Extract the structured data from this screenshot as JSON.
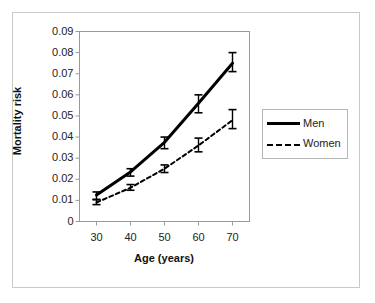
{
  "figure": {
    "background_color": "#ffffff",
    "border_color": "#c9c9c9",
    "plot_frame_color": "#9a9a9a"
  },
  "chart_data": {
    "type": "line",
    "title": "",
    "subtitle": "",
    "xlabel": "Age (years)",
    "ylabel": "Mortality risk",
    "x": [
      30,
      40,
      50,
      60,
      70
    ],
    "categories": [
      "30",
      "40",
      "50",
      "60",
      "70"
    ],
    "xlim": [
      25,
      75
    ],
    "ylim": [
      0,
      0.09
    ],
    "xticks": [
      30,
      40,
      50,
      60,
      70
    ],
    "xtick_labels": [
      "30",
      "40",
      "50",
      "60",
      "70"
    ],
    "yticks": [
      0,
      0.01,
      0.02,
      0.03,
      0.04,
      0.05,
      0.06,
      0.07,
      0.08,
      0.09
    ],
    "ytick_labels": [
      "0",
      "0.01",
      "0.02",
      "0.03",
      "0.04",
      "0.05",
      "0.06",
      "0.07",
      "0.08",
      "0.09"
    ],
    "grid": false,
    "legend_position": "right",
    "series": [
      {
        "name": "Men",
        "style": "solid",
        "color": "#000000",
        "line_width": 3,
        "values": [
          0.0125,
          0.0235,
          0.0375,
          0.056,
          0.075
        ],
        "error_low": [
          0.0105,
          0.0215,
          0.0345,
          0.0515,
          0.071
        ],
        "error_high": [
          0.014,
          0.025,
          0.04,
          0.06,
          0.08
        ]
      },
      {
        "name": "Women",
        "style": "dotted",
        "color": "#000000",
        "line_width": 2,
        "values": [
          0.009,
          0.016,
          0.025,
          0.036,
          0.048
        ],
        "error_low": [
          0.008,
          0.0148,
          0.0232,
          0.033,
          0.044
        ],
        "error_high": [
          0.0103,
          0.0175,
          0.0268,
          0.0395,
          0.053
        ]
      }
    ]
  },
  "legend": {
    "entries": [
      {
        "label": "Men"
      },
      {
        "label": "Women"
      }
    ]
  }
}
